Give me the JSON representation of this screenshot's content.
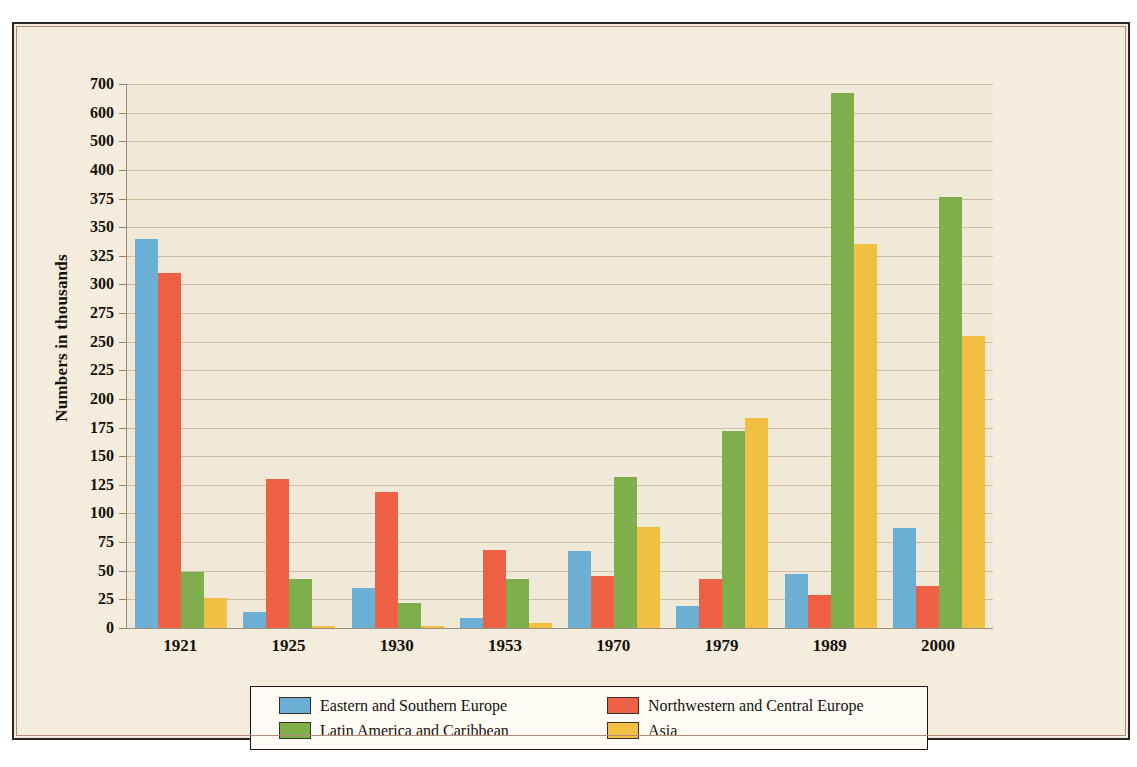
{
  "axis": {
    "y_title": "Numbers in thousands",
    "y_ticks": [
      "700",
      "600",
      "500",
      "400",
      "375",
      "350",
      "325",
      "300",
      "275",
      "250",
      "225",
      "200",
      "175",
      "150",
      "125",
      "100",
      "75",
      "50",
      "25",
      "0"
    ]
  },
  "legend": {
    "items": [
      {
        "label": "Eastern and Southern Europe",
        "color": "#6cafd4",
        "key": "eastern-southern-europe"
      },
      {
        "label": "Northwestern and Central Europe",
        "color": "#ef6144",
        "key": "northwestern-central-europe"
      },
      {
        "label": "Latin America and Caribbean",
        "color": "#7fae4c",
        "key": "latin-america-caribbean"
      },
      {
        "label": "Asia",
        "color": "#f1c043",
        "key": "asia"
      }
    ]
  },
  "chart_data": {
    "type": "bar",
    "title": "",
    "xlabel": "",
    "ylabel": "Numbers in thousands",
    "categories": [
      "1921",
      "1925",
      "1930",
      "1953",
      "1970",
      "1979",
      "1989",
      "2000"
    ],
    "series": [
      {
        "name": "Eastern and Southern Europe",
        "color": "#6cafd4",
        "values": [
          340,
          14,
          35,
          9,
          67,
          19,
          47,
          87
        ]
      },
      {
        "name": "Northwestern and Central Europe",
        "color": "#ef6144",
        "values": [
          310,
          130,
          119,
          68,
          45,
          43,
          29,
          37
        ]
      },
      {
        "name": "Latin America and Caribbean",
        "color": "#7fae4c",
        "values": [
          49,
          43,
          22,
          43,
          132,
          172,
          670,
          376
        ]
      },
      {
        "name": "Asia",
        "color": "#f1c043",
        "values": [
          26,
          2,
          2,
          4,
          88,
          183,
          335,
          255
        ]
      }
    ],
    "ylim": [
      0,
      700
    ],
    "y_tick_values": [
      0,
      25,
      50,
      75,
      100,
      125,
      150,
      175,
      200,
      225,
      250,
      275,
      300,
      325,
      350,
      375,
      400,
      500,
      600,
      700
    ],
    "y_scale_note": "non-linear above 400: 400/500/600/700 equally spaced",
    "grid": true,
    "legend_position": "bottom"
  }
}
